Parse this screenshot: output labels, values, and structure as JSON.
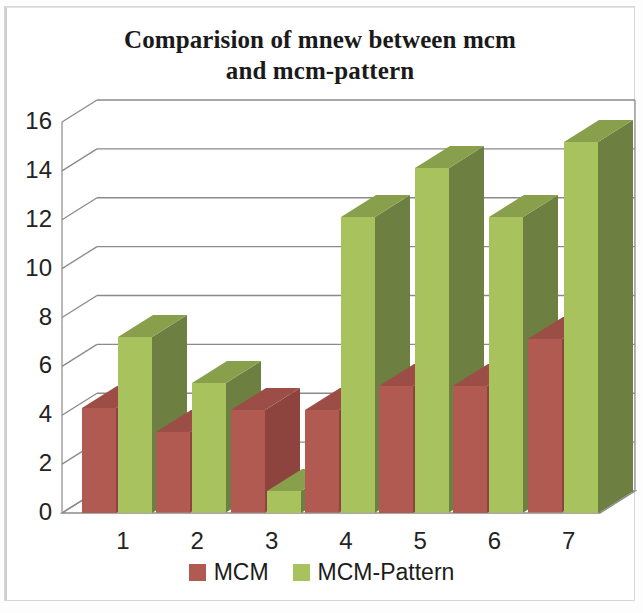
{
  "chart_data": {
    "type": "bar",
    "title": "Comparision of mnew between mcm and mcm-pattern",
    "title_lines": [
      "Comparision of mnew between mcm",
      "and mcm-pattern"
    ],
    "xlabel": "",
    "ylabel": "",
    "categories": [
      "1",
      "2",
      "3",
      "4",
      "5",
      "6",
      "7"
    ],
    "ylim": [
      0,
      16
    ],
    "yticks": [
      0,
      2,
      4,
      6,
      8,
      10,
      12,
      14,
      16
    ],
    "ytick_labels": [
      "0",
      "2",
      "4",
      "6",
      "8",
      "10",
      "12",
      "14",
      "16"
    ],
    "grid": true,
    "grid_axis": "y",
    "legend_position": "bottom",
    "three_d": true,
    "series": [
      {
        "name": "MCM",
        "color": "#b05a52",
        "values": [
          4.3,
          3.3,
          4.2,
          4.2,
          5.2,
          5.2,
          7.1
        ]
      },
      {
        "name": "MCM-Pattern",
        "color": "#a8c35e",
        "values": [
          7.2,
          5.3,
          0.9,
          12.1,
          14.1,
          12.1,
          15.2
        ]
      }
    ]
  },
  "colors": {
    "mcm_face": "#b05a52",
    "mcm_side": "#8e443e",
    "mcm_cap": "#9c4d46",
    "pattern_face": "#a8c35e",
    "pattern_side": "#6e7f42",
    "pattern_cap": "#88a04c",
    "grid": "#8a8a8a",
    "axis": "#8a8a8a",
    "floor": "#ffffff",
    "text": "#232323",
    "frame": "#d7d7d7"
  },
  "legend": {
    "items": [
      {
        "label": "MCM",
        "color": "#b05a52"
      },
      {
        "label": "MCM-Pattern",
        "color": "#a8c35e"
      }
    ]
  }
}
